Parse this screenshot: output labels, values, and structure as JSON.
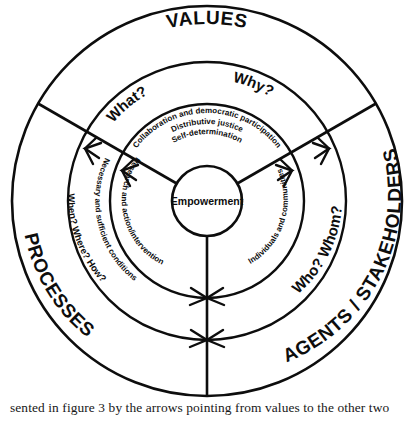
{
  "figure": {
    "type": "concentric-ring-diagram",
    "core": {
      "label": "Empowerment"
    },
    "rings": [
      {
        "id": "ring-core-values",
        "level": 1,
        "name": "inner-principles-ring",
        "segments": [
          {
            "sector": "top",
            "lines": [
              "Collaboration and democratic participation",
              "Distributive justice",
              "Self-determination"
            ]
          },
          {
            "sector": "lower-left",
            "lines": [
              "Research and action/intervention"
            ]
          },
          {
            "sector": "lower-right",
            "lines": [
              "Individuals and communities"
            ]
          }
        ]
      },
      {
        "id": "ring-conditions",
        "level": 2,
        "name": "conditions-ring",
        "segments": [
          {
            "sector": "lower-left",
            "lines": [
              "Necessary and sufficient conditions"
            ]
          }
        ]
      },
      {
        "id": "ring-questions",
        "level": 3,
        "name": "questions-ring",
        "segments": [
          {
            "sector": "top-left",
            "lines": [
              "What?"
            ]
          },
          {
            "sector": "top-right",
            "lines": [
              "Why?"
            ]
          },
          {
            "sector": "lower-left",
            "lines": [
              "When? Where? How?"
            ]
          },
          {
            "sector": "lower-right",
            "lines": [
              "Who?  Whom?"
            ]
          }
        ]
      },
      {
        "id": "ring-domains",
        "level": 4,
        "name": "outer-domains-ring",
        "segments": [
          {
            "sector": "top",
            "lines": [
              "VALUES"
            ]
          },
          {
            "sector": "lower-left",
            "lines": [
              "PROCESSES"
            ]
          },
          {
            "sector": "lower-right",
            "lines": [
              "AGENTS / STAKEHOLDERS"
            ]
          }
        ]
      }
    ],
    "labels": {
      "core": "Empowerment",
      "values": "VALUES",
      "processes": "PROCESSES",
      "agents": "AGENTS / STAKEHOLDERS",
      "what": "What?",
      "why": "Why?",
      "when_where_how": "When? Where? How?",
      "who_whom": "Who?  Whom?",
      "collaboration": "Collaboration and democratic participation",
      "distributive": "Distributive  justice",
      "self_determination": "Self-determination",
      "research": "Research and action/intervention",
      "individuals": "Individuals and communities",
      "necessary": "Necessary and sufficient conditions"
    },
    "arrows": {
      "count": 6,
      "description": "arrows pointing outward from values along the three sector divider spokes"
    },
    "colors": {
      "stroke": "#0d0d0d",
      "background": "#ffffff",
      "text": "#0d0d0d"
    }
  },
  "caption": {
    "text": "sented in figure 3 by the arrows pointing from values to the other two"
  }
}
